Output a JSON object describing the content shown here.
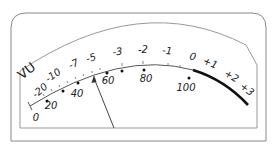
{
  "meter": {
    "title": "VU",
    "colors": {
      "frame": "#888888",
      "scale": "#555555",
      "red_zone": "#111111",
      "needle": "#444444",
      "text": "#222222"
    },
    "db_scale": [
      {
        "label": "-20",
        "x": 42,
        "y": 93,
        "rot": -40
      },
      {
        "label": "-10",
        "x": 55,
        "y": 78,
        "rot": -35
      },
      {
        "label": "-7",
        "x": 75,
        "y": 67,
        "rot": -25
      },
      {
        "label": "-5",
        "x": 92,
        "y": 61,
        "rot": -18
      },
      {
        "label": "-3",
        "x": 118,
        "y": 55,
        "rot": -8
      },
      {
        "label": "-2",
        "x": 143,
        "y": 53,
        "rot": 0
      },
      {
        "label": "-1",
        "x": 167,
        "y": 54,
        "rot": 5
      },
      {
        "label": "0",
        "x": 192,
        "y": 60,
        "rot": 12
      },
      {
        "label": "+1",
        "x": 209,
        "y": 66,
        "rot": 22
      },
      {
        "label": "+2",
        "x": 230,
        "y": 79,
        "rot": 30
      },
      {
        "label": "+3",
        "x": 245,
        "y": 92,
        "rot": 38
      }
    ],
    "percent_scale": [
      {
        "label": "0",
        "x": 36,
        "y": 121
      },
      {
        "label": "20",
        "x": 51,
        "y": 109
      },
      {
        "label": "40",
        "x": 77,
        "y": 97
      },
      {
        "label": "60",
        "x": 108,
        "y": 84
      },
      {
        "label": "80",
        "x": 146,
        "y": 82
      },
      {
        "label": "100",
        "x": 186,
        "y": 91
      }
    ],
    "percent_dots": [
      {
        "x": 47,
        "y": 101
      },
      {
        "x": 63,
        "y": 91
      },
      {
        "x": 78,
        "y": 83
      },
      {
        "x": 107,
        "y": 73
      },
      {
        "x": 122,
        "y": 71
      },
      {
        "x": 144,
        "y": 70
      },
      {
        "x": 189,
        "y": 78
      }
    ],
    "needle": {
      "from_x": 114,
      "from_y": 128,
      "to_x": 94,
      "to_y": 76
    }
  }
}
